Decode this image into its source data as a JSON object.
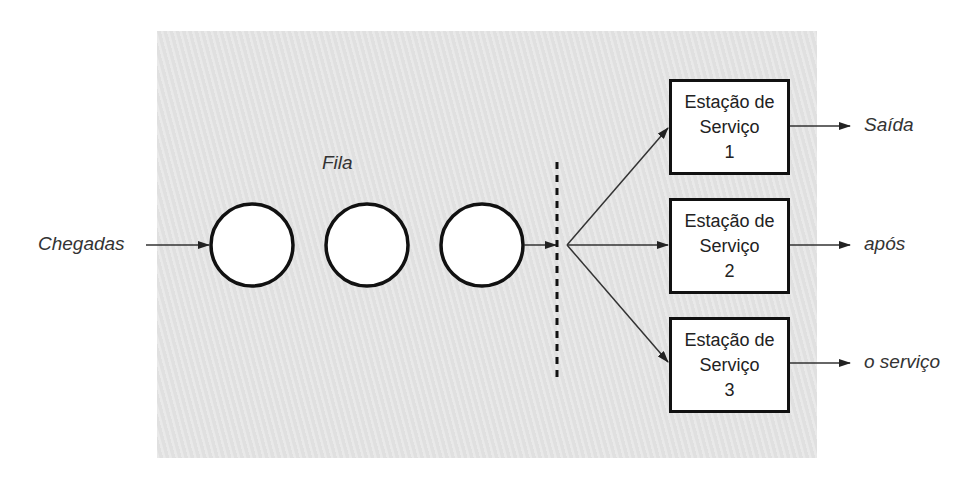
{
  "diagram": {
    "arrivals_label": "Chegadas",
    "queue_label": "Fila",
    "queue_items": 3,
    "stations": [
      {
        "line1": "Estação de",
        "line2": "Serviço",
        "number": "1"
      },
      {
        "line1": "Estação de",
        "line2": "Serviço",
        "number": "2"
      },
      {
        "line1": "Estação de",
        "line2": "Serviço",
        "number": "3"
      }
    ],
    "exit_labels": [
      "Saída",
      "após",
      "o serviço"
    ],
    "colors": {
      "panel": "#e4e4e4",
      "stroke": "#111111",
      "text": "#333333"
    }
  }
}
